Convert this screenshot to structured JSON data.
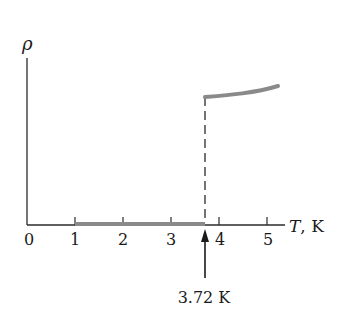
{
  "chart_data": {
    "type": "line",
    "title": "",
    "ylabel": "ρ",
    "xlabel": "T, K",
    "xlim": [
      0,
      5.3
    ],
    "x_ticks": [
      0,
      1,
      2,
      3,
      4,
      5
    ],
    "x_tick_labels": [
      "0",
      "1",
      "2",
      "3",
      "4",
      "5"
    ],
    "grid": false,
    "legend": null,
    "series": [
      {
        "name": "superconducting state (ρ = 0)",
        "x": [
          1.0,
          3.72
        ],
        "y": [
          0,
          0
        ]
      },
      {
        "name": "normal state resistivity",
        "x": [
          3.72,
          4.0,
          4.5,
          5.0,
          5.3
        ],
        "y": [
          1.0,
          1.005,
          1.02,
          1.045,
          1.07
        ]
      }
    ],
    "transition": {
      "x": 3.72,
      "style": "dashed vertical line"
    },
    "annotations": [
      {
        "text": "3.72 K",
        "x": 3.72,
        "type": "arrow pointing up to axis"
      }
    ]
  },
  "labels": {
    "y_axis": "ρ",
    "x_axis": "T, K",
    "ticks": [
      "0",
      "1",
      "2",
      "3",
      "4",
      "5"
    ],
    "annotation": "3.72 K"
  },
  "colors": {
    "axis": "#2a2a2a",
    "curve": "#8a8a8a",
    "text": "#1a1a1a"
  }
}
